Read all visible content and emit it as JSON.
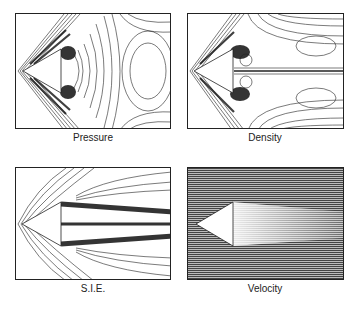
{
  "figure": {
    "panels": [
      {
        "id": "pressure",
        "label": "Pressure",
        "type": "contour"
      },
      {
        "id": "density",
        "label": "Density",
        "type": "contour"
      },
      {
        "id": "sie",
        "label": "S.I.E.",
        "type": "contour"
      },
      {
        "id": "velocity",
        "label": "Velocity",
        "type": "vector-field"
      }
    ]
  },
  "colors": {
    "line": "#222222",
    "background": "#ffffff",
    "dense": "#111111"
  }
}
